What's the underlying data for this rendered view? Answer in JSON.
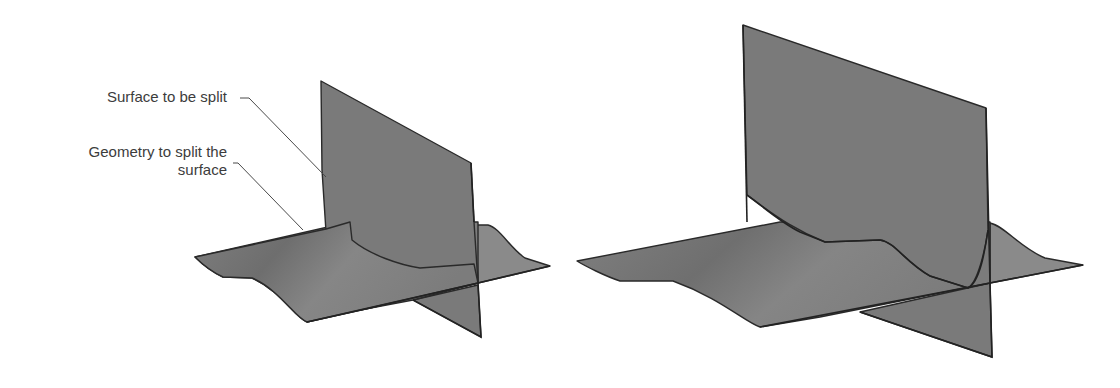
{
  "figure": {
    "left": {
      "title": "Before split",
      "labels": {
        "surface_to_split": "Surface to be split",
        "geometry_line1": "Geometry to split the",
        "geometry_line2": "surface"
      }
    },
    "right": {
      "title": "After split"
    }
  },
  "colors": {
    "surface_fill": "#7e7e7e",
    "edge": "#2a2a2a",
    "label_text": "#3c3c3c",
    "leader_line": "#4a4a4a",
    "background": "#ffffff"
  }
}
